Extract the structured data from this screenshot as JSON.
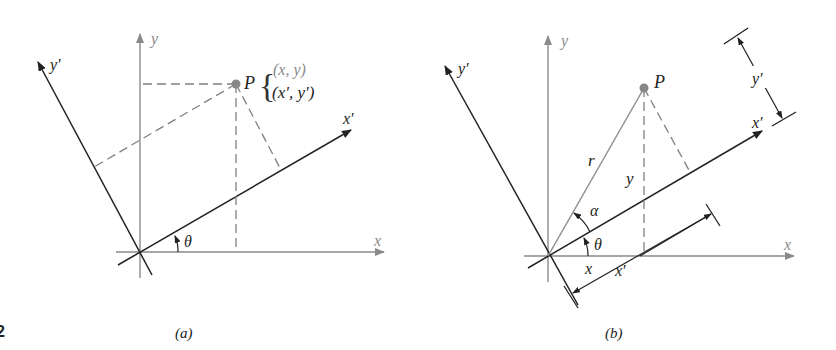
{
  "figure": {
    "fig_number_fragment": "2",
    "panel_a": {
      "caption": "(a)",
      "axes": {
        "x": "x",
        "y": "y",
        "x_rot": "x′",
        "y_rot": "y′"
      },
      "point": {
        "name": "P",
        "coords_original": "(x, y)",
        "coords_rotated": "(x′, y′)",
        "brace": "{"
      },
      "angle_label": "θ"
    },
    "panel_b": {
      "caption": "(b)",
      "axes": {
        "x": "x",
        "y": "y",
        "x_rot": "x′",
        "y_rot": "y′"
      },
      "point": {
        "name": "P"
      },
      "segment_labels": {
        "radius": "r",
        "vertical": "y",
        "horizontal": "x",
        "rotated_x_dim": "x′",
        "rotated_y_dim": "y′"
      },
      "angle_labels": {
        "theta": "θ",
        "alpha": "α"
      }
    },
    "colors": {
      "axis_gray": "#8a8a8a",
      "axis_dark": "#222222",
      "dashed": "#808080",
      "point": "#888888"
    }
  }
}
